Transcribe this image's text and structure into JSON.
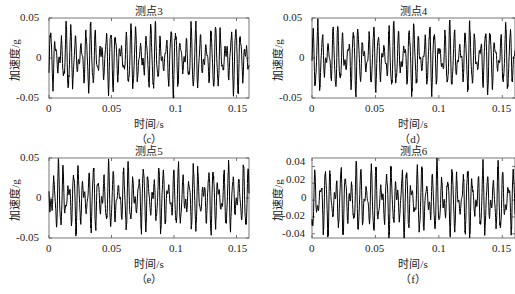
{
  "figure": {
    "panels": [
      {
        "id": "c",
        "title": "测点3",
        "sublabel": "（c）",
        "xlabel": "时间/s",
        "ylabel": "加速度/g",
        "yticks": [
          "0.05",
          "0",
          "-0.05"
        ],
        "xticks": [
          "0",
          "0.05",
          "0.1",
          "0.15"
        ]
      },
      {
        "id": "d",
        "title": "测点4",
        "sublabel": "（d）",
        "xlabel": "时间/s",
        "ylabel": "加速度/g",
        "yticks": [
          "0.05",
          "0",
          "-0.05"
        ],
        "xticks": [
          "0",
          "0.05",
          "0.1",
          "0.15"
        ]
      },
      {
        "id": "e",
        "title": "测点5",
        "sublabel": "（e）",
        "xlabel": "时间/s",
        "ylabel": "加速度/g",
        "yticks": [
          "0.05",
          "0",
          "-0.05"
        ],
        "xticks": [
          "0",
          "0.05",
          "0.1",
          "0.15"
        ]
      },
      {
        "id": "f",
        "title": "测点6",
        "sublabel": "（f）",
        "xlabel": "时间/s",
        "ylabel": "加速度/g",
        "yticks": [
          "0.04",
          "0.02",
          "0",
          "-0.02",
          "-0.04"
        ],
        "xticks": [
          "0",
          "0.05",
          "0.1",
          "0.15"
        ]
      }
    ]
  },
  "chart_data": [
    {
      "type": "line",
      "title": "测点3",
      "subfigure": "(c)",
      "xlabel": "时间/s",
      "ylabel": "加速度/g",
      "xlim": [
        0,
        0.16
      ],
      "ylim": [
        -0.05,
        0.05
      ],
      "xticks": [
        0,
        0.05,
        0.1,
        0.15
      ],
      "yticks": [
        -0.05,
        0,
        0.05
      ],
      "grid": false,
      "legend": null,
      "line_color": "#000000",
      "series": [
        {
          "name": "测点3",
          "description": "oscillating acceleration signal, amplitude ~±0.045 g, dominant period ~0.004 s",
          "x_range": [
            0,
            0.16
          ],
          "y_min": -0.05,
          "y_max": 0.045
        }
      ]
    },
    {
      "type": "line",
      "title": "测点4",
      "subfigure": "(d)",
      "xlabel": "时间/s",
      "ylabel": "加速度/g",
      "xlim": [
        0,
        0.16
      ],
      "ylim": [
        -0.05,
        0.05
      ],
      "xticks": [
        0,
        0.05,
        0.1,
        0.15
      ],
      "yticks": [
        -0.05,
        0,
        0.05
      ],
      "grid": false,
      "legend": null,
      "line_color": "#000000",
      "series": [
        {
          "name": "测点4",
          "description": "oscillating acceleration signal, amplitude ~±0.045 g",
          "x_range": [
            0,
            0.16
          ],
          "y_min": -0.045,
          "y_max": 0.045
        }
      ]
    },
    {
      "type": "line",
      "title": "测点5",
      "subfigure": "(e)",
      "xlabel": "时间/s",
      "ylabel": "加速度/g",
      "xlim": [
        0,
        0.16
      ],
      "ylim": [
        -0.05,
        0.05
      ],
      "xticks": [
        0,
        0.05,
        0.1,
        0.15
      ],
      "yticks": [
        -0.05,
        0,
        0.05
      ],
      "grid": false,
      "legend": null,
      "line_color": "#000000",
      "series": [
        {
          "name": "测点5",
          "description": "oscillating acceleration signal, amplitude ~±0.045 g",
          "x_range": [
            0,
            0.16
          ],
          "y_min": -0.05,
          "y_max": 0.045
        }
      ]
    },
    {
      "type": "line",
      "title": "测点6",
      "subfigure": "(f)",
      "xlabel": "时间/s",
      "ylabel": "加速度/g",
      "xlim": [
        0,
        0.16
      ],
      "ylim": [
        -0.045,
        0.05
      ],
      "xticks": [
        0,
        0.05,
        0.1,
        0.15
      ],
      "yticks": [
        -0.04,
        -0.02,
        0,
        0.02,
        0.04
      ],
      "grid": false,
      "legend": null,
      "line_color": "#000000",
      "series": [
        {
          "name": "测点6",
          "description": "oscillating acceleration signal, amplitude ~±0.048 g",
          "x_range": [
            0,
            0.16
          ],
          "y_min": -0.045,
          "y_max": 0.05
        }
      ]
    }
  ]
}
